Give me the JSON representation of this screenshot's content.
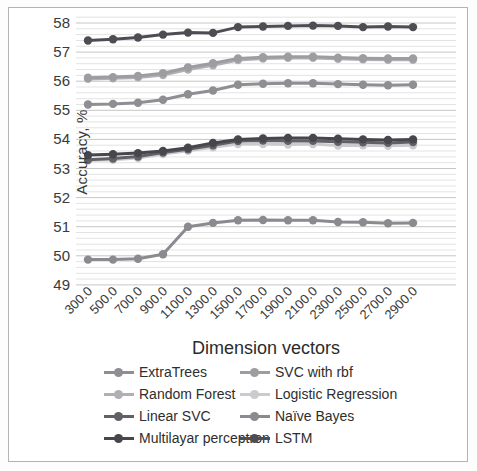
{
  "chart_data": {
    "type": "line",
    "title": "",
    "xlabel": "Dimension vectors",
    "ylabel": "Accuracy, %",
    "x": [
      300.0,
      500.0,
      700.0,
      900.0,
      1100.0,
      1300.0,
      1500.0,
      1700.0,
      1900.0,
      2100.0,
      2300.0,
      2500.0,
      2700.0,
      2900.0
    ],
    "x_tick_labels": [
      "300.0",
      "500.0",
      "700.0",
      "900.0",
      "1100.0",
      "1300.0",
      "1500.0",
      "1700.0",
      "1900.0",
      "2100.0",
      "2300.0",
      "2500.0",
      "2700.0",
      "2900.0"
    ],
    "y_ticks": [
      49,
      50,
      51,
      52,
      53,
      54,
      55,
      56,
      57,
      58
    ],
    "ylim": [
      49,
      58.3
    ],
    "minor_grid_step": 0.2,
    "grid": true,
    "legend_position": "bottom",
    "series": [
      {
        "name": "ExtraTrees",
        "slug": "extratrees",
        "color": "#8e8e93",
        "values": [
          55.2,
          55.22,
          55.26,
          55.36,
          55.55,
          55.68,
          55.88,
          55.91,
          55.93,
          55.93,
          55.9,
          55.88,
          55.86,
          55.88
        ]
      },
      {
        "name": "SVC with rbf",
        "slug": "svc-with-rbf",
        "color": "#9d9da1",
        "values": [
          56.12,
          56.14,
          56.18,
          56.27,
          56.47,
          56.62,
          56.78,
          56.82,
          56.84,
          56.84,
          56.81,
          56.79,
          56.78,
          56.78
        ]
      },
      {
        "name": "Random Forest",
        "slug": "random-forest",
        "color": "#b0b0b4",
        "values": [
          56.08,
          56.1,
          56.13,
          56.21,
          56.4,
          56.55,
          56.73,
          56.78,
          56.8,
          56.8,
          56.77,
          56.75,
          56.74,
          56.74
        ]
      },
      {
        "name": "Logistic Regression",
        "slug": "logistic-regression",
        "color": "#cbcbcf",
        "values": [
          53.27,
          53.3,
          53.36,
          53.5,
          53.61,
          53.73,
          53.84,
          53.84,
          53.82,
          53.84,
          53.79,
          53.8,
          53.78,
          53.8
        ]
      },
      {
        "name": "Linear SVC",
        "slug": "linear-svc",
        "color": "#606066",
        "values": [
          53.3,
          53.34,
          53.41,
          53.55,
          53.66,
          53.8,
          53.94,
          53.96,
          53.95,
          53.95,
          53.92,
          53.9,
          53.88,
          53.91
        ]
      },
      {
        "name": "Naïve Bayes",
        "slug": "naive-bayes",
        "color": "#8a8a8f",
        "values": [
          49.87,
          49.87,
          49.9,
          50.05,
          51.0,
          51.13,
          51.22,
          51.23,
          51.22,
          51.22,
          51.16,
          51.15,
          51.12,
          51.13
        ]
      },
      {
        "name": "Multilayar perceptron",
        "slug": "multilayar-perceptron",
        "color": "#46464d",
        "values": [
          53.46,
          53.49,
          53.53,
          53.6,
          53.71,
          53.88,
          54.0,
          54.03,
          54.05,
          54.05,
          54.02,
          54.0,
          53.98,
          54.0
        ]
      },
      {
        "name": "LSTM",
        "slug": "lstm",
        "color": "#4d4d54",
        "values": [
          57.4,
          57.44,
          57.5,
          57.6,
          57.67,
          57.66,
          57.86,
          57.88,
          57.9,
          57.91,
          57.9,
          57.86,
          57.88,
          57.86
        ]
      }
    ],
    "legend_order": [
      "ExtraTrees",
      "SVC with rbf",
      "Random Forest",
      "Logistic Regression",
      "Linear SVC",
      "Naïve Bayes",
      "Multilayar perceptron",
      "LSTM"
    ],
    "draw_order": [
      "Logistic Regression",
      "Random Forest",
      "SVC with rbf",
      "ExtraTrees",
      "Naïve Bayes",
      "Linear SVC",
      "Multilayar perceptron",
      "LSTM"
    ]
  },
  "style_colors": {
    "minor_gridline": "#e3e3e3",
    "major_gridline": "#c6c6c6",
    "tick_label": "#3a3a3a",
    "frame_border": "#b3b3b3"
  }
}
